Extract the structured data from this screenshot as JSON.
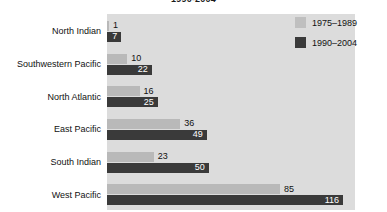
{
  "chart_data": {
    "type": "bar",
    "orientation": "horizontal",
    "title": "1990-2004",
    "xlabel": "",
    "ylabel": "",
    "xlim": [
      0,
      122
    ],
    "grid": false,
    "legend_position": "top-right",
    "categories": [
      "North Indian",
      "Southwestern Pacific",
      "North Atlantic",
      "East Pacific",
      "South Indian",
      "West Pacific"
    ],
    "series": [
      {
        "name": "1975–1989",
        "color": "#b9b9b9",
        "values": [
          1,
          10,
          16,
          36,
          23,
          85
        ]
      },
      {
        "name": "1990–2004",
        "color": "#3a3a3a",
        "values": [
          7,
          22,
          25,
          49,
          50,
          116
        ]
      }
    ]
  },
  "legend": {
    "items": [
      {
        "label": "1975–1989",
        "swatch": "light-gray-swatch"
      },
      {
        "label": "1990–2004",
        "swatch": "dark-gray-swatch"
      }
    ]
  },
  "colors": {
    "page_background": "#ffffff",
    "plot_background": "#dcdcdc",
    "series_1975_1989": "#b9b9b9",
    "series_1990_2004": "#3a3a3a",
    "label_text": "#111111",
    "inside_label_text": "#ffffff"
  }
}
